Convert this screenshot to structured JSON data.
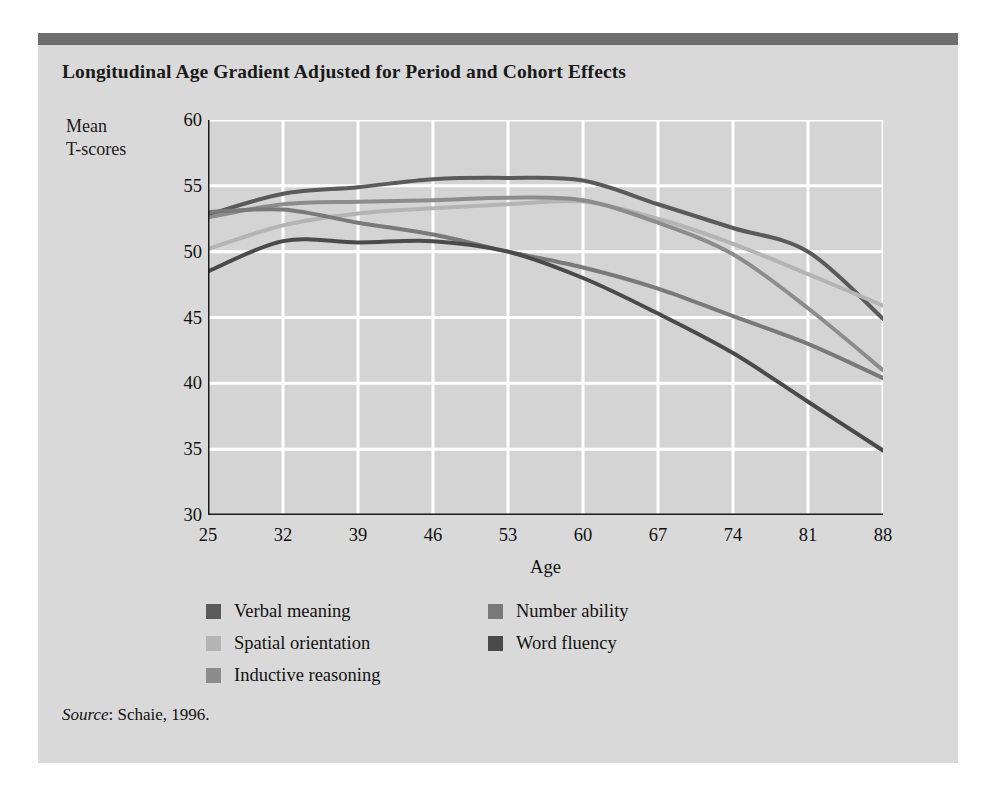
{
  "figure": {
    "title": "Longitudinal Age Gradient Adjusted for Period and Cohort Effects",
    "source_word": "Source",
    "source_rest": ": Schaie, 1996.",
    "panel_bg": "#d9d9d9",
    "top_rule_color": "#6e6e6e",
    "plot_bg": "#d4d4d4",
    "grid_color": "#ffffff",
    "axis_color": "#1a1a1a"
  },
  "chart_data": {
    "type": "line",
    "title": "Longitudinal Age Gradient Adjusted for Period and Cohort Effects",
    "xlabel": "Age",
    "ylabel": "Mean T-scores",
    "ylabel_lines": [
      "Mean",
      "T-scores"
    ],
    "x": [
      25,
      32,
      39,
      46,
      53,
      60,
      67,
      74,
      81,
      88
    ],
    "xtick_labels": [
      "25",
      "32",
      "39",
      "46",
      "53",
      "60",
      "67",
      "74",
      "81",
      "88"
    ],
    "ytick_labels": [
      "30",
      "35",
      "40",
      "45",
      "50",
      "55",
      "60"
    ],
    "yticks": [
      30,
      35,
      40,
      45,
      50,
      55,
      60
    ],
    "xlim": [
      25,
      88
    ],
    "ylim": [
      30,
      60
    ],
    "grid": true,
    "legend_position": "below-plot",
    "series": [
      {
        "name": "Verbal meaning",
        "color": "#5a5a5a",
        "values": [
          52.8,
          54.4,
          54.9,
          55.5,
          55.6,
          55.4,
          53.6,
          51.8,
          50.0,
          44.9
        ]
      },
      {
        "name": "Spatial orientation",
        "color": "#b4b4b4",
        "values": [
          50.2,
          52.0,
          52.9,
          53.3,
          53.6,
          53.8,
          52.5,
          50.6,
          48.3,
          45.9
        ]
      },
      {
        "name": "Inductive reasoning",
        "color": "#8c8c8c",
        "values": [
          52.6,
          53.6,
          53.8,
          53.9,
          54.1,
          53.9,
          52.2,
          49.8,
          45.7,
          41.0
        ]
      },
      {
        "name": "Number ability",
        "color": "#797979",
        "values": [
          53.0,
          53.2,
          52.2,
          51.3,
          50.0,
          48.8,
          47.2,
          45.1,
          43.0,
          40.4
        ]
      },
      {
        "name": "Word fluency",
        "color": "#4a4a4a",
        "values": [
          48.5,
          50.8,
          50.7,
          50.8,
          50.0,
          48.0,
          45.3,
          42.3,
          38.6,
          34.9
        ]
      }
    ]
  },
  "legend": {
    "left_items": [
      {
        "label": "Verbal meaning",
        "color": "#5a5a5a"
      },
      {
        "label": "Spatial orientation",
        "color": "#b4b4b4"
      },
      {
        "label": "Inductive reasoning",
        "color": "#8c8c8c"
      }
    ],
    "right_items": [
      {
        "label": "Number ability",
        "color": "#797979"
      },
      {
        "label": "Word fluency",
        "color": "#4a4a4a"
      }
    ]
  }
}
